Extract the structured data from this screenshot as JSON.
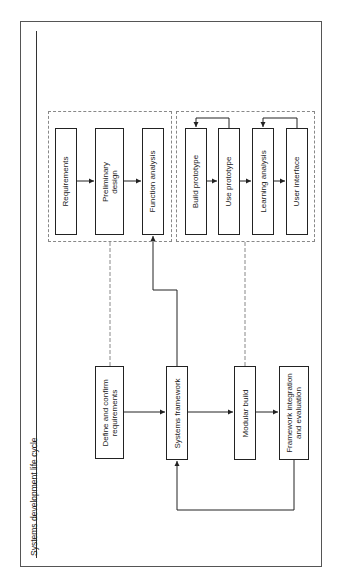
{
  "title": "Systems development life cycle",
  "groups": {
    "requirements_group": {
      "items": [
        {
          "label": "Requirements"
        },
        {
          "label_lines": [
            "Preliminary",
            "design"
          ]
        },
        {
          "label": "Function analysis"
        }
      ]
    },
    "prototype_group": {
      "items": [
        {
          "label": "Build prototype"
        },
        {
          "label": "Use prototype"
        },
        {
          "label": "Learning analysis"
        },
        {
          "label": "User interface"
        }
      ]
    }
  },
  "main_flow": [
    {
      "label_lines": [
        "Define and confirm",
        "requirements"
      ]
    },
    {
      "label": "Systems framework"
    },
    {
      "label": "Modular build"
    },
    {
      "label_lines": [
        "Framework integration",
        "and evaluation"
      ]
    }
  ],
  "colors": {
    "box_border": "#222222",
    "dashed_border": "#888888",
    "frame_border": "#555555",
    "background": "#ffffff"
  }
}
